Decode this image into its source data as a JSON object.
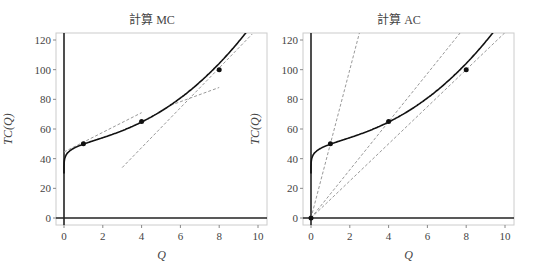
{
  "chart_data": [
    {
      "type": "line",
      "title": "計算 MC",
      "xlabel": "Q",
      "ylabel": "TC(Q)",
      "xlim": [
        -0.4,
        10.4
      ],
      "ylim": [
        -5,
        125
      ],
      "xticks": [
        0,
        2,
        4,
        6,
        8,
        10
      ],
      "yticks": [
        0,
        20,
        40,
        60,
        80,
        100,
        120
      ],
      "grid": false,
      "series": [
        {
          "name": "TC(Q)",
          "style": "solid",
          "formula": "30 + 19.41*Q^0.2 + 0.375*Q^2.3",
          "x_range": [
            0,
            9.75
          ]
        }
      ],
      "points": [
        {
          "x": 1,
          "y": 50
        },
        {
          "x": 4,
          "y": 65
        },
        {
          "x": 8,
          "y": 100
        }
      ],
      "dashed_lines": [
        {
          "x": [
            0,
            4
          ],
          "y": [
            44.5,
            71
          ]
        },
        {
          "x": [
            5.5,
            8
          ],
          "y": [
            76,
            88
          ]
        },
        {
          "x": [
            3,
            9.7
          ],
          "y": [
            34,
            124
          ]
        }
      ]
    },
    {
      "type": "line",
      "title": "計算 AC",
      "xlabel": "Q",
      "ylabel": "TC(Q)",
      "xlim": [
        -0.4,
        10.4
      ],
      "ylim": [
        -5,
        125
      ],
      "xticks": [
        0,
        2,
        4,
        6,
        8,
        10
      ],
      "yticks": [
        0,
        20,
        40,
        60,
        80,
        100,
        120
      ],
      "grid": false,
      "series": [
        {
          "name": "TC(Q)",
          "style": "solid",
          "formula": "30 + 19.41*Q^0.2 + 0.375*Q^2.3",
          "x_range": [
            0,
            9.75
          ]
        }
      ],
      "points": [
        {
          "x": 0,
          "y": 0
        },
        {
          "x": 1,
          "y": 50
        },
        {
          "x": 4,
          "y": 65
        },
        {
          "x": 8,
          "y": 100
        }
      ],
      "dashed_lines": [
        {
          "x": [
            0,
            2.5
          ],
          "y": [
            0,
            125
          ]
        },
        {
          "x": [
            0,
            7.7
          ],
          "y": [
            0,
            125
          ]
        },
        {
          "x": [
            0,
            10
          ],
          "y": [
            0,
            125
          ]
        }
      ]
    }
  ]
}
